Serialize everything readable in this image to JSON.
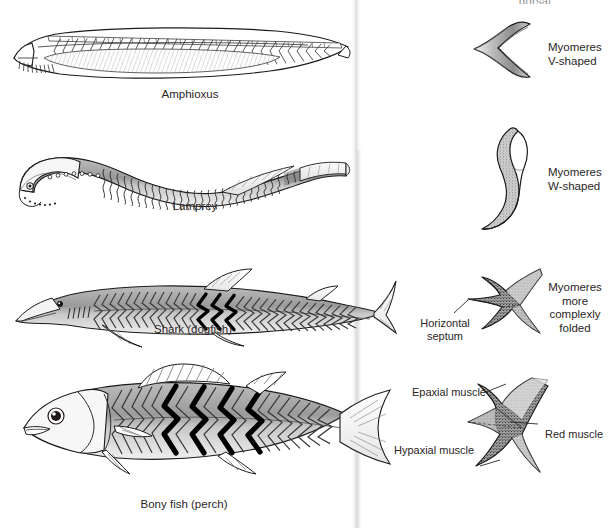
{
  "figure": {
    "top_cut_text": "dorsal",
    "rows": [
      {
        "animal": "Amphioxus",
        "caption": "Amphioxus",
        "myomere_label": "Myomeres\nV-shaped",
        "myomere_label_line1": "Myomeres",
        "myomere_label_line2": "V-shaped",
        "shape": "v-shaped"
      },
      {
        "animal": "Lamprey",
        "caption": "Lamprey",
        "myomere_label_line1": "Myomeres",
        "myomere_label_line2": "W-shaped",
        "shape": "w-shaped"
      },
      {
        "animal": "Shark",
        "caption": "Shark (dogfish)",
        "myomere_label_line1": "Myomeres",
        "myomere_label_line2": "more",
        "myomere_label_line3": "complexly",
        "myomere_label_line4": "folded",
        "shape": "complexly-folded",
        "callouts": [
          {
            "line1": "Horizontal",
            "line2": "septum"
          }
        ]
      },
      {
        "animal": "Bony fish",
        "caption": "Bony fish (perch)",
        "shape": "complexly-folded-detailed",
        "callouts": [
          {
            "text": "Epaxial muscle"
          },
          {
            "text": "Red muscle"
          },
          {
            "text": "Hypaxial muscle"
          }
        ]
      }
    ],
    "colors": {
      "ink": "#231f20",
      "muscle_dark": "#000000",
      "muscle_mid": "#8f8f8f",
      "muscle_light": "#d8d8d8",
      "paper": "#ffffff"
    }
  }
}
